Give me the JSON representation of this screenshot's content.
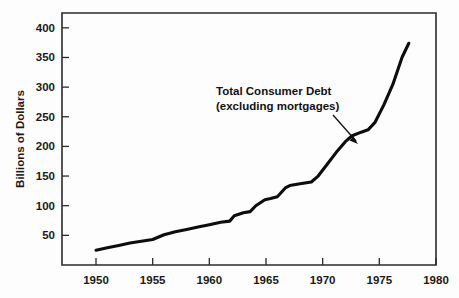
{
  "chart_data": {
    "type": "line",
    "title": "",
    "xlabel": "",
    "ylabel": "Billions of Dollars",
    "xlim": [
      1947,
      1980
    ],
    "ylim": [
      0,
      425
    ],
    "grid": false,
    "legend": "none",
    "annotations": [
      {
        "name": "series-callout",
        "line1": "Total Consumer Debt",
        "line2": "(excluding mortgages)",
        "points_to_x": 1972.6,
        "points_to_y": 218
      }
    ],
    "xticks": [
      1950,
      1955,
      1960,
      1965,
      1970,
      1975,
      1980
    ],
    "xtick_labels": [
      "1950",
      "1955",
      "1960",
      "1965",
      "1970",
      "1975",
      "1980"
    ],
    "yticks": [
      50,
      100,
      150,
      200,
      250,
      300,
      350,
      400
    ],
    "ytick_labels": [
      "50",
      "100",
      "150",
      "200",
      "250",
      "300",
      "350",
      "400"
    ],
    "series": [
      {
        "name": "Total Consumer Debt (excluding mortgages)",
        "color": "#0d0d0d",
        "x": [
          1950.0,
          1951.0,
          1952.0,
          1953.0,
          1954.0,
          1955.0,
          1956.0,
          1957.0,
          1958.0,
          1959.0,
          1960.0,
          1961.0,
          1961.8,
          1962.2,
          1963.0,
          1963.6,
          1964.1,
          1964.9,
          1965.4,
          1966.0,
          1966.7,
          1967.1,
          1968.0,
          1969.0,
          1969.6,
          1970.4,
          1971.2,
          1972.0,
          1972.6,
          1973.4,
          1974.0,
          1974.6,
          1975.4,
          1976.2,
          1977.0,
          1977.6
        ],
        "y": [
          25.0,
          29.0,
          33.0,
          37.0,
          40.0,
          43.0,
          51.0,
          56.0,
          60.0,
          64.0,
          68.0,
          72.0,
          74.0,
          83.0,
          88.0,
          90.0,
          100.0,
          110.0,
          112.0,
          115.0,
          130.0,
          134.0,
          137.0,
          140.0,
          150.0,
          170.0,
          190.0,
          208.0,
          218.0,
          224.0,
          228.0,
          240.0,
          270.0,
          305.0,
          350.0,
          374.0
        ]
      }
    ],
    "colors": {
      "line": "#0d0d0d",
      "axis": "#2b2b2b",
      "text": "#1a1a1a",
      "background": "#fdfdfd"
    }
  }
}
